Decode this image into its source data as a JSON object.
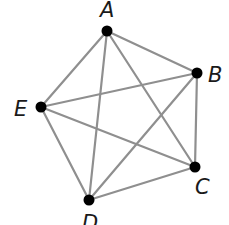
{
  "diagram": {
    "type": "complete-graph",
    "title": "",
    "colors": {
      "edge": "#8f8f8f",
      "node": "#000000",
      "label": "#1a1a1a"
    },
    "nodes": [
      {
        "id": "A",
        "label": "A",
        "x": 107,
        "y": 31,
        "lx": 100,
        "ly": 17
      },
      {
        "id": "B",
        "label": "B",
        "x": 197,
        "y": 73,
        "lx": 208,
        "ly": 82
      },
      {
        "id": "C",
        "label": "C",
        "x": 195,
        "y": 167,
        "lx": 195,
        "ly": 194
      },
      {
        "id": "D",
        "label": "D",
        "x": 89,
        "y": 200,
        "lx": 82,
        "ly": 230
      },
      {
        "id": "E",
        "label": "E",
        "x": 41,
        "y": 107,
        "lx": 14,
        "ly": 116
      }
    ],
    "edges": [
      [
        "A",
        "B"
      ],
      [
        "A",
        "C"
      ],
      [
        "A",
        "D"
      ],
      [
        "A",
        "E"
      ],
      [
        "B",
        "C"
      ],
      [
        "B",
        "D"
      ],
      [
        "B",
        "E"
      ],
      [
        "C",
        "D"
      ],
      [
        "C",
        "E"
      ],
      [
        "D",
        "E"
      ]
    ]
  }
}
